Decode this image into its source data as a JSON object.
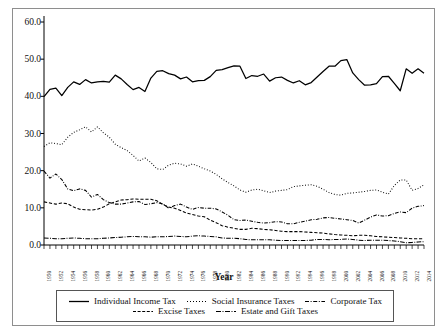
{
  "chart_data": {
    "type": "line",
    "title": "",
    "xlabel": "Year",
    "ylabel": "",
    "xlim": [
      1950,
      2014
    ],
    "ylim": [
      0.0,
      60.0
    ],
    "yticks": [
      "0.0",
      "10.0",
      "20.0",
      "30.0",
      "40.0",
      "50.0",
      "60.0"
    ],
    "grid": false,
    "legend_position": "bottom",
    "x": [
      1950,
      1951,
      1952,
      1953,
      1954,
      1955,
      1956,
      1957,
      1958,
      1959,
      1960,
      1961,
      1962,
      1963,
      1964,
      1965,
      1966,
      1967,
      1968,
      1969,
      1970,
      1971,
      1972,
      1973,
      1974,
      1975,
      1976,
      1977,
      1978,
      1979,
      1980,
      1981,
      1982,
      1983,
      1984,
      1985,
      1986,
      1987,
      1988,
      1989,
      1990,
      1991,
      1992,
      1993,
      1994,
      1995,
      1996,
      1997,
      1998,
      1999,
      2000,
      2001,
      2002,
      2003,
      2004,
      2005,
      2006,
      2007,
      2008,
      2009,
      2010,
      2011,
      2012,
      2013,
      2014
    ],
    "xtick_labels": [
      "1950",
      "1952",
      "1954",
      "1956",
      "1958",
      "1960",
      "1962",
      "1964",
      "1966",
      "1968",
      "1970",
      "1972",
      "1974",
      "1976",
      "1978",
      "1980",
      "1982",
      "1984",
      "1986",
      "1988",
      "1990",
      "1992",
      "1994",
      "1996",
      "1998",
      "2000",
      "2002",
      "2004",
      "2006",
      "2008",
      "2010",
      "2012",
      "2014"
    ],
    "series": [
      {
        "name": "Individual Income Tax",
        "style": "solid",
        "values": [
          39.9,
          41.9,
          42.2,
          40.2,
          42.4,
          43.9,
          43.2,
          44.5,
          43.6,
          43.9,
          44.0,
          43.8,
          45.7,
          44.7,
          43.2,
          41.8,
          42.4,
          41.3,
          44.9,
          46.7,
          46.9,
          46.1,
          45.7,
          44.7,
          45.2,
          43.9,
          44.2,
          44.3,
          45.3,
          47.0,
          47.2,
          47.7,
          48.2,
          48.1,
          44.8,
          45.6,
          45.4,
          46.0,
          44.1,
          45.0,
          45.2,
          44.3,
          43.6,
          44.2,
          43.1,
          43.7,
          45.2,
          46.7,
          48.1,
          48.1,
          49.6,
          49.9,
          46.3,
          44.5,
          43.0,
          43.1,
          43.4,
          45.3,
          45.4,
          43.5,
          41.5,
          47.4,
          46.2,
          47.4,
          46.2
        ]
      },
      {
        "name": "Social Insurance Taxes",
        "style": "dotted",
        "values": [
          26.5,
          27.5,
          27.3,
          27.0,
          29.0,
          30.3,
          31.0,
          31.8,
          30.4,
          31.8,
          30.2,
          29.0,
          27.1,
          26.2,
          25.4,
          24.1,
          22.6,
          23.4,
          22.2,
          20.5,
          20.3,
          21.5,
          22.0,
          21.8,
          21.2,
          21.8,
          21.2,
          20.5,
          19.9,
          19.0,
          17.8,
          16.8,
          15.9,
          14.8,
          14.2,
          14.8,
          15.0,
          14.6,
          14.1,
          14.5,
          14.7,
          14.9,
          15.7,
          15.9,
          16.1,
          16.2,
          15.8,
          15.0,
          14.1,
          13.6,
          13.4,
          13.9,
          14.0,
          14.2,
          14.4,
          14.7,
          14.8,
          14.2,
          13.7,
          16.0,
          17.5,
          17.5,
          14.7,
          15.2,
          16.2
        ]
      },
      {
        "name": "Corporate Tax",
        "style": "dashdot",
        "values": [
          19.9,
          18.0,
          19.1,
          17.6,
          15.1,
          14.6,
          15.1,
          14.7,
          12.9,
          13.6,
          12.2,
          11.4,
          11.0,
          11.0,
          11.3,
          11.6,
          11.7,
          10.9,
          11.1,
          11.4,
          11.1,
          9.9,
          10.6,
          11.0,
          10.2,
          9.6,
          10.1,
          9.9,
          9.9,
          9.7,
          8.9,
          8.0,
          6.8,
          6.6,
          6.7,
          6.4,
          6.1,
          5.9,
          6.0,
          6.3,
          6.2,
          5.7,
          5.7,
          6.1,
          6.4,
          6.8,
          6.9,
          7.3,
          7.4,
          7.2,
          7.0,
          6.8,
          6.6,
          5.9,
          6.7,
          7.5,
          8.1,
          7.8,
          7.9,
          8.5,
          8.9,
          8.7,
          9.9,
          10.4,
          10.6
        ]
      },
      {
        "name": "Excise Taxes",
        "style": "dashed",
        "values": [
          11.6,
          11.3,
          11.0,
          11.3,
          11.1,
          10.2,
          9.6,
          9.5,
          9.4,
          9.6,
          10.2,
          11.1,
          11.6,
          12.1,
          12.2,
          12.4,
          12.3,
          12.3,
          12.3,
          11.9,
          10.9,
          10.2,
          9.9,
          9.3,
          8.6,
          8.2,
          7.8,
          7.6,
          6.7,
          6.0,
          5.2,
          4.8,
          4.5,
          4.2,
          4.2,
          4.5,
          4.4,
          4.2,
          4.1,
          3.9,
          3.7,
          3.6,
          3.6,
          3.6,
          3.5,
          3.4,
          3.3,
          3.2,
          3.0,
          2.8,
          2.7,
          2.6,
          2.5,
          2.6,
          2.6,
          2.5,
          2.3,
          2.2,
          2.1,
          2.0,
          1.9,
          1.8,
          1.7,
          1.7,
          1.7
        ]
      },
      {
        "name": "Estate and Gift Taxes",
        "style": "dashdotdot",
        "values": [
          1.9,
          1.8,
          1.7,
          1.7,
          1.8,
          1.9,
          1.8,
          1.7,
          1.7,
          1.7,
          1.8,
          1.9,
          2.0,
          2.1,
          2.2,
          2.3,
          2.2,
          2.2,
          2.1,
          2.2,
          2.2,
          2.3,
          2.4,
          2.3,
          2.2,
          2.4,
          2.5,
          2.4,
          2.3,
          2.2,
          1.9,
          1.8,
          1.8,
          1.7,
          1.5,
          1.4,
          1.4,
          1.4,
          1.4,
          1.3,
          1.2,
          1.2,
          1.2,
          1.2,
          1.2,
          1.3,
          1.5,
          1.5,
          1.4,
          1.5,
          1.5,
          1.6,
          1.5,
          1.3,
          1.2,
          1.3,
          1.3,
          1.3,
          1.2,
          1.1,
          0.9,
          0.6,
          0.7,
          0.8,
          0.9
        ]
      }
    ]
  },
  "axis": {
    "x_title": "Year"
  },
  "legend": {
    "items": [
      {
        "label": "Individual Income Tax",
        "style": "solid"
      },
      {
        "label": "Social Insurance Taxes",
        "style": "dotted"
      },
      {
        "label": "Corporate Tax",
        "style": "dashdot"
      },
      {
        "label": "Excise Taxes",
        "style": "dashed"
      },
      {
        "label": "Estate and Gift Taxes",
        "style": "dashdotdot"
      }
    ]
  },
  "colors": {
    "line": "#000000",
    "frame": "#8e8e8e",
    "legend_border": "#555555",
    "text": "#111111",
    "background": "#ffffff"
  }
}
